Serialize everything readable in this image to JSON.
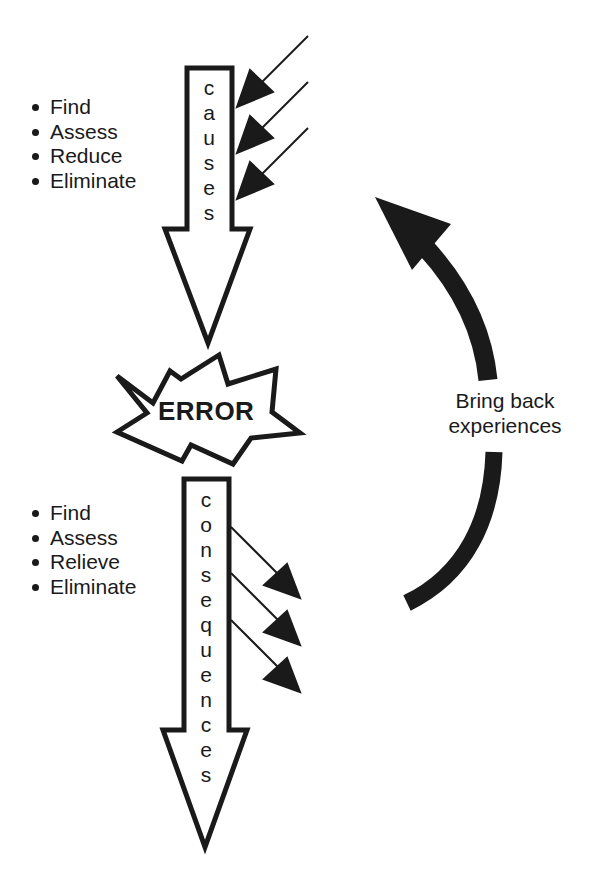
{
  "causes": {
    "word": "causes",
    "letters": [
      "c",
      "a",
      "u",
      "s",
      "e",
      "s"
    ],
    "actions": [
      "Find",
      "Assess",
      "Reduce",
      "Eliminate"
    ]
  },
  "error": {
    "label": "ERROR"
  },
  "consequences": {
    "word": "consequences",
    "letters": [
      "c",
      "o",
      "n",
      "s",
      "e",
      "q",
      "u",
      "e",
      "n",
      "c",
      "e",
      "s"
    ],
    "actions": [
      "Find",
      "Assess",
      "Relieve",
      "Eliminate"
    ]
  },
  "feedback_loop": {
    "label_line1": "Bring back",
    "label_line2": "experiences"
  },
  "colors": {
    "ink": "#1a1a1a",
    "background": "#ffffff"
  }
}
